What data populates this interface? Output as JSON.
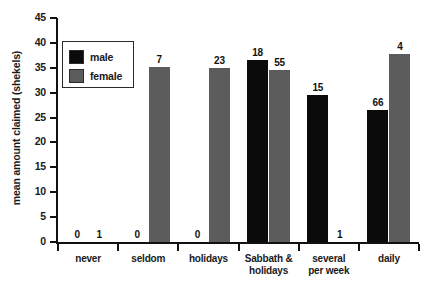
{
  "chart_data": {
    "type": "bar",
    "title": "",
    "xlabel": "",
    "ylabel": "mean amount claimed (shekels)",
    "ylim": [
      0,
      45
    ],
    "ytick_step": 5,
    "yticks": [
      0,
      5,
      10,
      15,
      20,
      25,
      30,
      35,
      40,
      45
    ],
    "grid": false,
    "legend_position": "upper-left-inside",
    "categories": [
      "never",
      "seldom",
      "holidays",
      "Sabbath & holidays",
      "several per week",
      "daily"
    ],
    "category_lines": [
      [
        "never"
      ],
      [
        "seldom"
      ],
      [
        "holidays"
      ],
      [
        "Sabbath &",
        "holidays"
      ],
      [
        "several",
        "per week"
      ],
      [
        "daily"
      ]
    ],
    "series": [
      {
        "name": "male",
        "color": "#0b0b0b",
        "values": [
          0,
          0,
          0,
          36.5,
          29.5,
          26.5
        ],
        "sample_sizes": [
          0,
          0,
          0,
          18,
          15,
          66
        ]
      },
      {
        "name": "female",
        "color": "#5c5c5c",
        "values": [
          0,
          35.2,
          35.0,
          34.6,
          0,
          37.7
        ],
        "sample_sizes": [
          1,
          7,
          23,
          55,
          1,
          4
        ]
      }
    ],
    "bar_labels_are_sample_sizes": true
  },
  "legend": {
    "items": [
      {
        "label": "male",
        "swatch": "black-square-swatch"
      },
      {
        "label": "female",
        "swatch": "gray-textured-square-swatch"
      }
    ]
  },
  "axis": {
    "y_title": "mean amount claimed (shekels)",
    "y_labels": [
      "45",
      "40",
      "35",
      "30",
      "25",
      "20",
      "15",
      "10",
      "5",
      "0"
    ]
  }
}
